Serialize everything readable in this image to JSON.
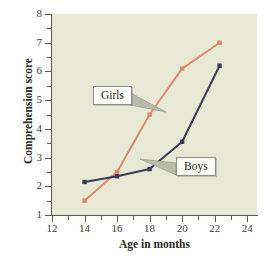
{
  "chart_data": {
    "type": "line",
    "title": "",
    "xlabel": "Age in months",
    "ylabel": "Comprehension score",
    "xlim": [
      12,
      24.6
    ],
    "ylim": [
      1,
      8
    ],
    "grid": false,
    "legend_position": "inline-callouts",
    "x_ticks_major": [
      12,
      14,
      16,
      18,
      20,
      22,
      24
    ],
    "x_ticks_minor": [
      13,
      15,
      17,
      19,
      21,
      23
    ],
    "y_ticks_major": [
      1,
      2,
      3,
      4,
      5,
      6,
      7,
      8
    ],
    "y_ticks_minor": [
      1.5,
      2.5,
      3.5,
      4.5,
      5.5,
      6.5,
      7.5
    ],
    "x_tick_labels": [
      "12",
      "14",
      "16",
      "18",
      "20",
      "22",
      "24"
    ],
    "y_tick_labels": [
      "1",
      "2",
      "3",
      "4",
      "5",
      "6",
      "7",
      "8"
    ],
    "series": [
      {
        "name": "Girls",
        "color": "#d98c6a",
        "marker": "square",
        "x": [
          14,
          16,
          18,
          20,
          22.3
        ],
        "values": [
          1.5,
          2.5,
          4.5,
          6.1,
          7.0
        ]
      },
      {
        "name": "Boys",
        "color": "#3a3a5c",
        "marker": "square",
        "x": [
          14,
          16,
          18,
          20,
          22.3
        ],
        "values": [
          2.15,
          2.35,
          2.6,
          3.55,
          6.2
        ]
      }
    ],
    "annotations": [
      {
        "label": "Girls",
        "target_series": "Girls"
      },
      {
        "label": "Boys",
        "target_series": "Boys"
      }
    ]
  },
  "colors": {
    "plot_background": "#e8e9d5",
    "page_background": "#ffffff",
    "axis": "#5a5a52",
    "girls_line": "#d98c6a",
    "boys_line": "#3a3a5c",
    "callout_fill": "#fbfbf7",
    "callout_border": "#8e8e84",
    "pointer_fill": "#b9bda8"
  }
}
